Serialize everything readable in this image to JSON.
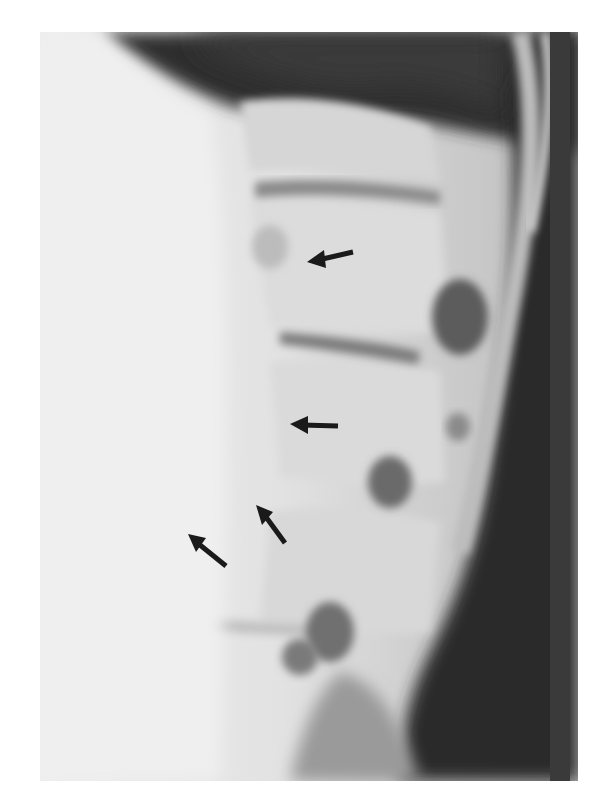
{
  "image": {
    "description": "Lateral radiograph of the lumbar spine with four black arrows pointing to anterior vertebral margins",
    "palette": {
      "soft_tissue_light": "#e8e8e8",
      "bone_mid": "#c9c9c9",
      "foramen_dark": "#6f6f6f",
      "background_dark": "#2e2e2e",
      "arrow": "#1a1a1a",
      "page_bg": "#ffffff"
    },
    "arrows": [
      {
        "id": 1,
        "tip": [
          307,
          262
        ],
        "tail": [
          353,
          252
        ],
        "direction": "left"
      },
      {
        "id": 2,
        "tip": [
          290,
          424
        ],
        "tail": [
          338,
          426
        ],
        "direction": "left"
      },
      {
        "id": 3,
        "tip": [
          256,
          505
        ],
        "tail": [
          285,
          543
        ],
        "direction": "up-left"
      },
      {
        "id": 4,
        "tip": [
          188,
          534
        ],
        "tail": [
          226,
          566
        ],
        "direction": "up-left"
      }
    ]
  }
}
